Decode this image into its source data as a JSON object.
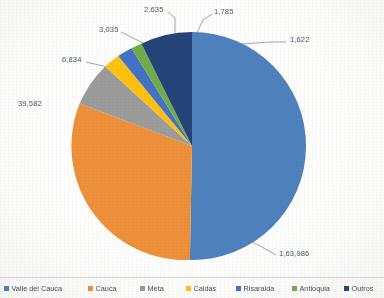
{
  "chart_data": {
    "type": "pie",
    "title": "",
    "categories": [
      "Valle del Cauca",
      "Cauca",
      "Meta",
      "Caldas",
      "Risaralda",
      "Antioquia",
      "Outros"
    ],
    "values": [
      163986,
      39582,
      6834,
      3035,
      2635,
      1785,
      1622
    ],
    "data_labels": [
      "1,63,986",
      "39,582",
      "6,834",
      "3,035",
      "2,635",
      "1,785",
      "1,622"
    ],
    "colors": [
      "#4E81BD",
      "#ED9039",
      "#9C9C9C",
      "#FFC211",
      "#4472C4",
      "#70AD47",
      "#264478"
    ],
    "total": 219479,
    "start_angle_deg": 0,
    "direction": "clockwise",
    "legend_position": "bottom",
    "grid": false,
    "xlabel": "",
    "ylabel": ""
  },
  "labels": {
    "valle": "1,63,986",
    "cauca": "39,582",
    "meta": "6,834",
    "caldas": "3,035",
    "risaralda": "2,635",
    "antioquia": "1,785",
    "outros": "1,622"
  },
  "legend": {
    "items": [
      {
        "label": "Valle del Cauca",
        "color": "#4E81BD"
      },
      {
        "label": "Cauca",
        "color": "#ED9039"
      },
      {
        "label": "Meta",
        "color": "#9C9C9C"
      },
      {
        "label": "Caldas",
        "color": "#FFC211"
      },
      {
        "label": "Risaralda",
        "color": "#4472C4"
      },
      {
        "label": "Antioquia",
        "color": "#70AD47"
      },
      {
        "label": "Outros",
        "color": "#264478"
      }
    ]
  }
}
